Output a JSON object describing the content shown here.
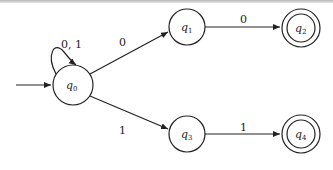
{
  "diagram": {
    "type": "finite-automaton",
    "start_state": "q0",
    "states": [
      {
        "id": "q0",
        "name": "q",
        "sub": "0",
        "accepting": false,
        "x": 73,
        "y": 85
      },
      {
        "id": "q1",
        "name": "q",
        "sub": "1",
        "accepting": false,
        "x": 187,
        "y": 27
      },
      {
        "id": "q2",
        "name": "q",
        "sub": "2",
        "accepting": true,
        "x": 301,
        "y": 28
      },
      {
        "id": "q3",
        "name": "q",
        "sub": "3",
        "accepting": false,
        "x": 187,
        "y": 134
      },
      {
        "id": "q4",
        "name": "q",
        "sub": "4",
        "accepting": true,
        "x": 301,
        "y": 134
      }
    ],
    "transitions": [
      {
        "from": "q0",
        "to": "q0",
        "label": "0, 1"
      },
      {
        "from": "q0",
        "to": "q1",
        "label": "0"
      },
      {
        "from": "q1",
        "to": "q2",
        "label": "0"
      },
      {
        "from": "q0",
        "to": "q3",
        "label": "1"
      },
      {
        "from": "q3",
        "to": "q4",
        "label": "1"
      }
    ],
    "colors": {
      "stroke": "#222222",
      "background": "#ffffff"
    }
  }
}
